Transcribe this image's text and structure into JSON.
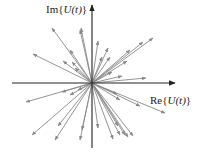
{
  "diagram": {
    "origin": [
      92,
      83
    ],
    "axes": {
      "x_label": "Re{U(t)}",
      "x_label_parts": {
        "prefix": "Re{",
        "var": "U",
        "arg": "(t)",
        "suffix": "}"
      },
      "y_label": "Im{U(t)}",
      "y_label_parts": {
        "prefix": "Im{",
        "var": "U",
        "arg": "(t)",
        "suffix": "}"
      },
      "x_axis": {
        "from": [
          12,
          83
        ],
        "to": [
          175,
          83
        ]
      },
      "y_axis": {
        "from": [
          92,
          148
        ],
        "to": [
          92,
          5
        ]
      }
    },
    "colors": {
      "axis": "#222222",
      "phasor": "#8a8a8a",
      "text": "#222222"
    },
    "phasors": [
      [
        52,
        28
      ],
      [
        33,
        54
      ],
      [
        81,
        28
      ],
      [
        70,
        50
      ],
      [
        63,
        61
      ],
      [
        72,
        62
      ],
      [
        75,
        68
      ],
      [
        80,
        30
      ],
      [
        98,
        41
      ],
      [
        102,
        57
      ],
      [
        108,
        48
      ],
      [
        153,
        38
      ],
      [
        143,
        42
      ],
      [
        130,
        50
      ],
      [
        110,
        57
      ],
      [
        127,
        61
      ],
      [
        146,
        78
      ],
      [
        122,
        76
      ],
      [
        112,
        72
      ],
      [
        165,
        113
      ],
      [
        140,
        106
      ],
      [
        117,
        94
      ],
      [
        120,
        100
      ],
      [
        98,
        128
      ],
      [
        80,
        140
      ],
      [
        82,
        130
      ],
      [
        113,
        139
      ],
      [
        120,
        135
      ],
      [
        125,
        135
      ],
      [
        128,
        137
      ],
      [
        133,
        136
      ],
      [
        118,
        126
      ],
      [
        26,
        102
      ],
      [
        58,
        126
      ],
      [
        32,
        135
      ],
      [
        55,
        140
      ],
      [
        62,
        92
      ],
      [
        78,
        90
      ],
      [
        70,
        95
      ]
    ]
  }
}
